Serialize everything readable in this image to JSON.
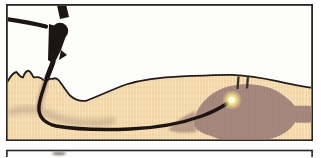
{
  "figure": {
    "type": "medical-illustration",
    "visible_panels": "2 (second panel cut off at bottom edge)"
  },
  "colors": {
    "background": "#ffffff",
    "panel_fill": "#fdfdfc",
    "frame": "#2a2520",
    "skin": "#f3d7a9",
    "skin_grid_light": "#fae6c2",
    "skin_grid_dark": "#ddb988",
    "outline": "#211c18",
    "stomach": "#a5857b",
    "stomach_grid": "#b39488",
    "shadow": "#93786b",
    "scope": "#1d1511",
    "glow_core": "#fffbe4",
    "glow_mid": "#f3e188",
    "marks": "#36302b",
    "next_panel_smudge": "#6e6761"
  }
}
